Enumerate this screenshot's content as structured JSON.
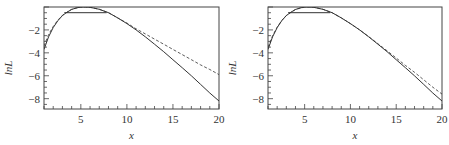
{
  "chart_data": [
    {
      "type": "line",
      "panel": "left",
      "title": "",
      "xlabel": "x",
      "ylabel": "lnL",
      "xlim": [
        1,
        20
      ],
      "ylim": [
        -8.9,
        0
      ],
      "xticks": [
        5,
        10,
        15,
        20
      ],
      "yticks": [
        -2,
        -4,
        -6,
        -8
      ],
      "grid": false,
      "series": [
        {
          "name": "exact",
          "style": "solid",
          "x": [
            1,
            1.5,
            2,
            2.5,
            3,
            3.5,
            4,
            4.5,
            5,
            5.5,
            6,
            7,
            8,
            9,
            10,
            11,
            12,
            13,
            14,
            15,
            16,
            17,
            18,
            19,
            20
          ],
          "y": [
            -3.7,
            -2.6,
            -1.8,
            -1.2,
            -0.75,
            -0.45,
            -0.22,
            -0.08,
            -0.01,
            0.0,
            -0.03,
            -0.2,
            -0.5,
            -0.95,
            -1.45,
            -2.0,
            -2.6,
            -3.25,
            -3.9,
            -4.6,
            -5.3,
            -6.0,
            -6.75,
            -7.5,
            -8.2
          ]
        },
        {
          "name": "approximation",
          "style": "dashed",
          "x": [
            1,
            1.5,
            2,
            2.5,
            3,
            4,
            5,
            5.5,
            6,
            7,
            8,
            9,
            10,
            11,
            12,
            13,
            14,
            15,
            16,
            17,
            18,
            19,
            20
          ],
          "y": [
            -3.4,
            -2.4,
            -1.7,
            -1.15,
            -0.72,
            -0.2,
            -0.01,
            0.0,
            -0.03,
            -0.2,
            -0.5,
            -0.95,
            -1.4,
            -1.9,
            -2.35,
            -2.8,
            -3.25,
            -3.7,
            -4.15,
            -4.6,
            -5.05,
            -5.45,
            -5.9
          ]
        },
        {
          "name": "level",
          "style": "solid",
          "x": [
            3.2,
            7.8
          ],
          "y": [
            -0.5,
            -0.5
          ]
        }
      ]
    },
    {
      "type": "line",
      "panel": "right",
      "title": "",
      "xlabel": "x",
      "ylabel": "lnL",
      "xlim": [
        1,
        20
      ],
      "ylim": [
        -8.9,
        0
      ],
      "xticks": [
        5,
        10,
        15,
        20
      ],
      "yticks": [
        -2,
        -4,
        -6,
        -8
      ],
      "grid": false,
      "series": [
        {
          "name": "exact",
          "style": "solid",
          "x": [
            1,
            1.5,
            2,
            2.5,
            3,
            3.5,
            4,
            4.5,
            5,
            5.5,
            6,
            7,
            8,
            9,
            10,
            11,
            12,
            13,
            14,
            15,
            16,
            17,
            18,
            19,
            20
          ],
          "y": [
            -3.7,
            -2.6,
            -1.8,
            -1.2,
            -0.75,
            -0.45,
            -0.22,
            -0.08,
            -0.01,
            0.0,
            -0.03,
            -0.2,
            -0.5,
            -0.95,
            -1.45,
            -2.0,
            -2.6,
            -3.25,
            -3.9,
            -4.6,
            -5.3,
            -6.0,
            -6.75,
            -7.5,
            -8.2
          ]
        },
        {
          "name": "approximation",
          "style": "dashed",
          "x": [
            1,
            1.5,
            2,
            2.5,
            3,
            4,
            5,
            5.5,
            6,
            7,
            8,
            9,
            10,
            11,
            12,
            13,
            14,
            15,
            16,
            17,
            18,
            19,
            20
          ],
          "y": [
            -3.5,
            -2.5,
            -1.75,
            -1.18,
            -0.74,
            -0.21,
            -0.01,
            0.0,
            -0.03,
            -0.2,
            -0.5,
            -0.95,
            -1.45,
            -2.0,
            -2.58,
            -3.2,
            -3.82,
            -4.45,
            -5.1,
            -5.7,
            -6.35,
            -7.0,
            -7.6
          ]
        },
        {
          "name": "level",
          "style": "solid",
          "x": [
            3.2,
            7.8
          ],
          "y": [
            -0.5,
            -0.5
          ]
        }
      ]
    }
  ],
  "panels": [
    {
      "ylabel": "lnL",
      "xlabel": "x",
      "xtick_labels": [
        "5",
        "10",
        "15",
        "20"
      ],
      "ytick_labels": [
        "−2",
        "−4",
        "−6",
        "−8"
      ]
    },
    {
      "ylabel": "lnL",
      "xlabel": "x",
      "xtick_labels": [
        "5",
        "10",
        "15",
        "20"
      ],
      "ytick_labels": [
        "−2",
        "−4",
        "−6",
        "−8"
      ]
    }
  ],
  "colors": {
    "line": "#333333",
    "axis": "#444444",
    "background": "#ffffff"
  }
}
